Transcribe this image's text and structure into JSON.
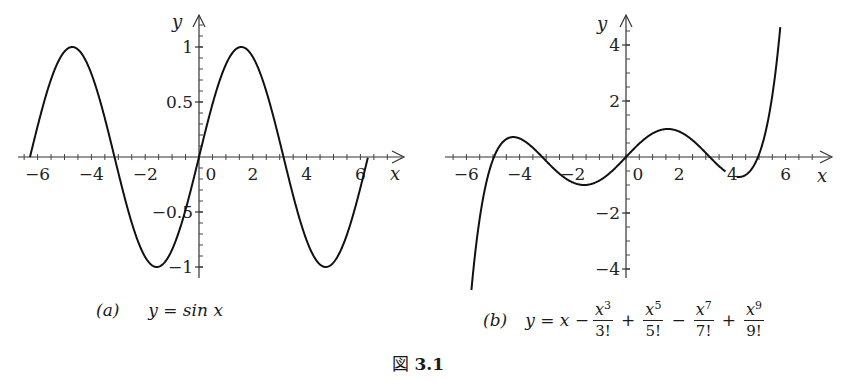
{
  "chart_data": [
    {
      "type": "line",
      "id": "a",
      "caption_letter": "(a)",
      "caption_equation": "y = sin x",
      "function": "sin(x)",
      "xlabel": "x",
      "ylabel": "y",
      "xlim": [
        -6.6,
        7.4
      ],
      "ylim": [
        -1.05,
        1.35
      ],
      "x_tick_labels": [
        "−6",
        "−4",
        "−2",
        "0",
        "2",
        "4",
        "6"
      ],
      "x_ticks": [
        -6,
        -4,
        -2,
        0,
        2,
        4,
        6
      ],
      "y_tick_labels": [
        "1",
        "0.5",
        "−0.5",
        "−1"
      ],
      "y_ticks": [
        1,
        0.5,
        -0.5,
        -1
      ],
      "x_domain": [
        -6.28,
        6.28
      ],
      "grid": false,
      "series": [
        {
          "name": "sin x",
          "x_range": [
            -6.283,
            6.283
          ],
          "points": [
            [
              -6.28,
              0
            ],
            [
              -4.71,
              1
            ],
            [
              -3.14,
              0
            ],
            [
              -1.57,
              -1
            ],
            [
              0,
              0
            ],
            [
              1.57,
              1
            ],
            [
              3.14,
              0
            ],
            [
              4.71,
              -1
            ],
            [
              6.28,
              0
            ]
          ]
        }
      ]
    },
    {
      "type": "line",
      "id": "b",
      "caption_letter": "(b)",
      "caption_equation": "y = x − x^3/3! + x^5/5! − x^7/7! + x^9/9!",
      "function": "x - x^3/6 + x^5/120 - x^7/5040 + x^9/362880",
      "xlabel": "x",
      "ylabel": "y",
      "xlim": [
        -6.3,
        7.0
      ],
      "ylim": [
        -4.2,
        5.2
      ],
      "x_tick_labels": [
        "−6",
        "−4",
        "−2",
        "0",
        "2",
        "4",
        "6"
      ],
      "x_ticks": [
        -6,
        -4,
        -2,
        0,
        2,
        4,
        6
      ],
      "y_tick_labels": [
        "4",
        "2",
        "−2",
        "−4"
      ],
      "y_ticks": [
        4,
        2,
        -2,
        -4
      ],
      "grid": false,
      "series": [
        {
          "name": "Taylor polynomial (degree 9) of sin x",
          "x_range": [
            -5.9,
            5.8
          ],
          "points": [
            [
              -5.9,
              -4.0
            ],
            [
              -5.0,
              0.0
            ],
            [
              -4.4,
              0.55
            ],
            [
              -3.14,
              0
            ],
            [
              -1.6,
              -0.95
            ],
            [
              0,
              0
            ],
            [
              1.6,
              0.95
            ],
            [
              3.14,
              0
            ],
            [
              4.2,
              -0.55
            ],
            [
              5.0,
              0.0
            ],
            [
              5.8,
              4.1
            ]
          ]
        }
      ]
    }
  ],
  "captions": {
    "a": {
      "letter": "(a)",
      "lhs": "y = sin x"
    },
    "b": {
      "letter": "(b)",
      "lhs": "y = x −",
      "terms": [
        {
          "num_var": "x",
          "num_exp": "3",
          "den": "3!",
          "op_after": "+"
        },
        {
          "num_var": "x",
          "num_exp": "5",
          "den": "5!",
          "op_after": "−"
        },
        {
          "num_var": "x",
          "num_exp": "7",
          "den": "7!",
          "op_after": "+"
        },
        {
          "num_var": "x",
          "num_exp": "9",
          "den": "9!",
          "op_after": ""
        }
      ]
    }
  },
  "figure": {
    "prefix": "図",
    "number": "3.1"
  }
}
